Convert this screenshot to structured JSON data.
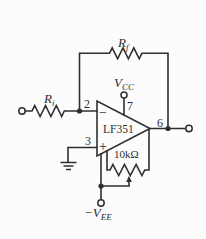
{
  "diagram": {
    "ic_label": "LF351",
    "inverting_sign": "−",
    "noninverting_sign": "+",
    "pins": {
      "inverting": "2",
      "noninverting": "3",
      "v_plus": "7",
      "output": "6"
    },
    "labels": {
      "feedback_resistor": {
        "base": "R",
        "sub": "f"
      },
      "input_resistor": {
        "base": "R",
        "sub": "i"
      },
      "positive_supply": {
        "base": "V",
        "sub": "CC"
      },
      "negative_supply": {
        "base": "−V",
        "sub": "EE"
      },
      "potentiometer_value": "10kΩ"
    }
  },
  "colors": {
    "line": "#2f2f2f",
    "background": "#fcfcfc"
  }
}
